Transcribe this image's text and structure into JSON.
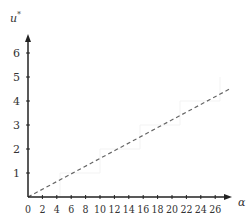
{
  "chart_data": {
    "type": "line",
    "title": "",
    "xlabel": "α",
    "ylabel": "u*",
    "xlim": [
      0,
      28
    ],
    "ylim": [
      0,
      7
    ],
    "grid": false,
    "legend": null,
    "x_ticks": [
      "0",
      "2",
      "4",
      "6",
      "8",
      "10",
      "12",
      "14",
      "16",
      "18",
      "20",
      "22",
      "24",
      "26"
    ],
    "y_ticks": [
      "1",
      "2",
      "3",
      "4",
      "5",
      "6"
    ],
    "series": [
      {
        "name": "dashed line",
        "style": "dashed",
        "color": "#666666",
        "x": [
          0,
          28
        ],
        "y": [
          0,
          4.5
        ]
      }
    ]
  },
  "colors": {
    "axis": "#222222",
    "series": "#666666",
    "faint_lines": "#f2f2f2"
  }
}
